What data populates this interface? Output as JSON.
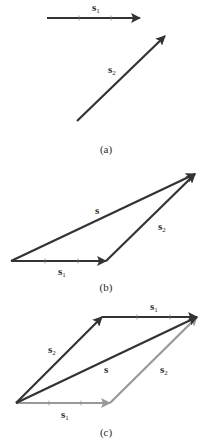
{
  "figure": {
    "panels": [
      {
        "caption": "(a)",
        "vectors": [
          {
            "name": "s1",
            "label_base": "s",
            "label_sub": "1",
            "from": [
              47,
              18
            ],
            "to": [
              140,
              18
            ],
            "color": "#333333"
          },
          {
            "name": "s2",
            "label_base": "s",
            "label_sub": "2",
            "from": [
              77,
              121
            ],
            "to": [
              165,
              36
            ],
            "color": "#333333"
          }
        ]
      },
      {
        "caption": "(b)",
        "vectors": [
          {
            "name": "s1",
            "label_base": "s",
            "label_sub": "1",
            "from": [
              11,
              261
            ],
            "to": [
              106,
              261
            ],
            "color": "#333333"
          },
          {
            "name": "s2",
            "label_base": "s",
            "label_sub": "2",
            "from": [
              106,
              261
            ],
            "to": [
              195,
              174
            ],
            "color": "#333333"
          },
          {
            "name": "s",
            "label_base": "s",
            "label_sub": "",
            "from": [
              11,
              261
            ],
            "to": [
              195,
              174
            ],
            "color": "#333333"
          }
        ]
      },
      {
        "caption": "(c)",
        "vectors": [
          {
            "name": "s1-bottom",
            "label_base": "s",
            "label_sub": "1",
            "from": [
              16,
              403
            ],
            "to": [
              110,
              403
            ],
            "color": "#999999"
          },
          {
            "name": "s2-right",
            "label_base": "s",
            "label_sub": "2",
            "from": [
              110,
              403
            ],
            "to": [
              197,
              317
            ],
            "color": "#999999"
          },
          {
            "name": "s2-left",
            "label_base": "s",
            "label_sub": "2",
            "from": [
              16,
              403
            ],
            "to": [
              102,
              317
            ],
            "color": "#333333"
          },
          {
            "name": "s1-top",
            "label_base": "s",
            "label_sub": "1",
            "from": [
              102,
              317
            ],
            "to": [
              197,
              317
            ],
            "color": "#333333"
          },
          {
            "name": "s",
            "label_base": "s",
            "label_sub": "",
            "from": [
              16,
              403
            ],
            "to": [
              197,
              317
            ],
            "color": "#333333"
          }
        ]
      }
    ],
    "labels": {
      "a_s1": {
        "base": "s",
        "sub": "1"
      },
      "a_s2": {
        "base": "s",
        "sub": "2"
      },
      "b_s": {
        "base": "s"
      },
      "b_s1": {
        "base": "s",
        "sub": "1"
      },
      "b_s2": {
        "base": "s",
        "sub": "2"
      },
      "c_s1_top": {
        "base": "s",
        "sub": "1"
      },
      "c_s2_left": {
        "base": "s",
        "sub": "2"
      },
      "c_s": {
        "base": "s"
      },
      "c_s2_right": {
        "base": "s",
        "sub": "2"
      },
      "c_s1_bottom": {
        "base": "s",
        "sub": "1"
      }
    },
    "captions": {
      "a": "(a)",
      "b": "(b)",
      "c": "(c)"
    }
  }
}
